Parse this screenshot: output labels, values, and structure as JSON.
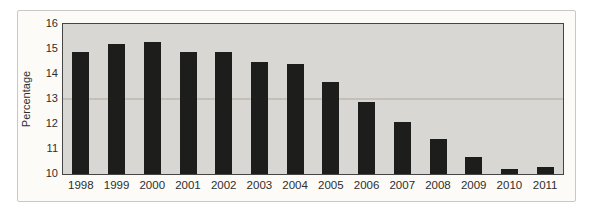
{
  "chart_data": {
    "type": "bar",
    "ylabel": "Percentage",
    "categories": [
      "1998",
      "1999",
      "2000",
      "2001",
      "2002",
      "2003",
      "2004",
      "2005",
      "2006",
      "2007",
      "2008",
      "2009",
      "2010",
      "2011"
    ],
    "values": [
      14.9,
      15.2,
      15.3,
      14.9,
      14.9,
      14.5,
      14.4,
      13.7,
      12.9,
      12.1,
      11.4,
      10.7,
      10.2,
      10.3
    ],
    "ylim": [
      10,
      16
    ],
    "yticks": [
      16,
      15,
      14,
      13,
      12,
      11,
      10
    ],
    "grid": false,
    "legend_position": "none",
    "colors": {
      "bar": "#1d1d1b",
      "plot_bg": "#d8d7d3",
      "plot_border": "#454545",
      "panel_bg": "#fcfbf8",
      "panel_border": "#c9c8c5",
      "text": "#2e2e2c"
    }
  }
}
